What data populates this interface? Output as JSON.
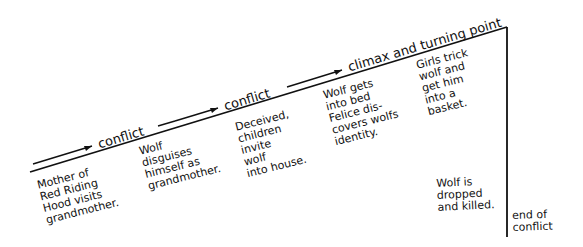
{
  "diagram": {
    "type": "plot-structure-line",
    "phases": [
      {
        "label": "conflict"
      },
      {
        "label": "conflict"
      },
      {
        "label": "climax and turning point"
      }
    ],
    "events": [
      {
        "text": "Mother of\nRed Riding\nHood visits\ngrandmother."
      },
      {
        "text": "Wolf\ndisguises\nhimself as\ngrandmother."
      },
      {
        "text": "Deceived,\nchildren\ninvite\nwolf\ninto house."
      },
      {
        "text": "Wolf gets\ninto bed\nFelice dis-\ncovers wolfs\nidentity."
      },
      {
        "text": "Girls trick\nwolf and\nget him\ninto a\nbasket."
      },
      {
        "text": "Wolf is\ndropped\nand killed."
      }
    ],
    "ending": {
      "text": "end of\nconflict"
    },
    "colors": {
      "ink": "#111111",
      "background": "#ffffff"
    }
  }
}
